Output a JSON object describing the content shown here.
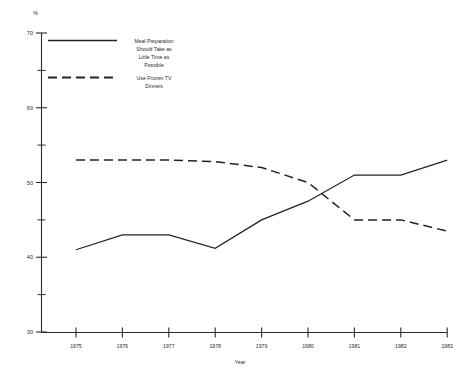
{
  "chart_data": {
    "type": "line",
    "title": "",
    "subtitle": "",
    "xlabel": "Year",
    "ylabel": "%",
    "unit_label": "%",
    "categories": [
      "1975",
      "1976",
      "1977",
      "1978",
      "1979",
      "1980",
      "1981",
      "1982",
      "1983"
    ],
    "x": [
      1975,
      1976,
      1977,
      1978,
      1979,
      1980,
      1981,
      1982,
      1983
    ],
    "xlim": [
      1975,
      1983
    ],
    "ylim": [
      30,
      70
    ],
    "grid": false,
    "legend_position": "top-left-inside",
    "y_ticks_major": [
      30,
      40,
      50,
      60,
      70
    ],
    "y_ticks_minor": [
      35,
      45,
      55,
      65
    ],
    "y_tick_labels": [
      "30",
      "40",
      "50",
      "60",
      "70"
    ],
    "series": [
      {
        "name": "Meal Preparation Should Take as Little Time as Possible",
        "style": "solid",
        "color": "#222222",
        "values": [
          41.0,
          43.0,
          43.0,
          41.2,
          45.0,
          47.5,
          51.0,
          51.0,
          53.0
        ]
      },
      {
        "name": "Use Frozen TV Dinners",
        "style": "dashed",
        "color": "#222222",
        "values": [
          53.0,
          53.0,
          53.0,
          52.8,
          52.0,
          50.0,
          45.0,
          45.0,
          43.5
        ]
      }
    ]
  },
  "legend": {
    "entries": [
      {
        "style": "solid",
        "lines": [
          "Meal Preparation",
          "Should Take as",
          "Little Time as",
          "Possible"
        ]
      },
      {
        "style": "dashed",
        "lines": [
          "Use Frozen TV",
          "Dinners"
        ]
      }
    ]
  }
}
